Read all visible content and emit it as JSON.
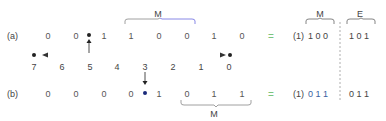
{
  "row_a": {
    "label": "(a)",
    "bits": [
      "0",
      "0",
      "1",
      "1",
      "0",
      "0",
      "1",
      "0"
    ],
    "mantissa_label": "M",
    "equals": "=",
    "result_implicit": "(1)",
    "result_mantissa": "1 0 0",
    "result_exponent": "1 0 1",
    "result_mantissa_label": "M",
    "result_exponent_label": "E"
  },
  "positions": [
    "7",
    "6",
    "5",
    "4",
    "3",
    "2",
    "1",
    "0"
  ],
  "row_b": {
    "label": "(b)",
    "bits": [
      "0",
      "0",
      "0",
      "0",
      "1",
      "0",
      "1",
      "1"
    ],
    "mantissa_label": "M",
    "equals": "=",
    "result_implicit": "(1)",
    "result_mantissa": "0 1 1",
    "result_exponent": "0 1 1"
  },
  "colors": {
    "arrow_left": "#7fe07f",
    "arrow_right": "#e07a7a",
    "brace_left": "#888888",
    "brace_right": "#6a6ae0",
    "equals": "#7bc47f",
    "result_b_mantissa": "#3a5fa0"
  }
}
